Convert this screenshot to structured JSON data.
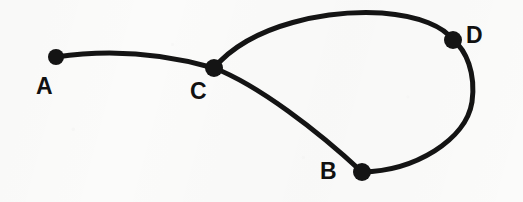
{
  "figure": {
    "type": "node-link-graph-diagram",
    "background_color": "#fbfbfa",
    "ink_color": "#141414",
    "width": 523,
    "height": 202
  },
  "nodes": [
    {
      "id": "A",
      "label": "A",
      "cx": 56,
      "cy": 57,
      "r": 8,
      "label_x": 36,
      "label_y": 75
    },
    {
      "id": "C",
      "label": "C",
      "cx": 214,
      "cy": 68,
      "r": 9,
      "label_x": 190,
      "label_y": 80
    },
    {
      "id": "B",
      "label": "B",
      "cx": 362,
      "cy": 172,
      "r": 9,
      "label_x": 320,
      "label_y": 160
    },
    {
      "id": "D",
      "label": "D",
      "cx": 453,
      "cy": 40,
      "r": 9,
      "label_x": 466,
      "label_y": 24
    }
  ],
  "edges": [
    {
      "id": "A-C",
      "from": "A",
      "to": "C",
      "stroke_width": 5,
      "path": "M 56 57 C 110 49, 165 54, 214 68"
    },
    {
      "id": "C-D",
      "from": "C",
      "to": "D",
      "stroke_width": 5,
      "path": "M 214 68 C 252 23, 330 10, 382 13 C 420 16, 444 27, 453 40"
    },
    {
      "id": "C-B",
      "from": "C",
      "to": "B",
      "stroke_width": 5,
      "path": "M 214 68 C 258 85, 318 131, 362 172"
    },
    {
      "id": "B-D",
      "from": "B",
      "to": "D",
      "stroke_width": 5,
      "path": "M 362 172 C 415 171, 466 140, 472 102 C 476 73, 466 50, 453 40"
    }
  ]
}
